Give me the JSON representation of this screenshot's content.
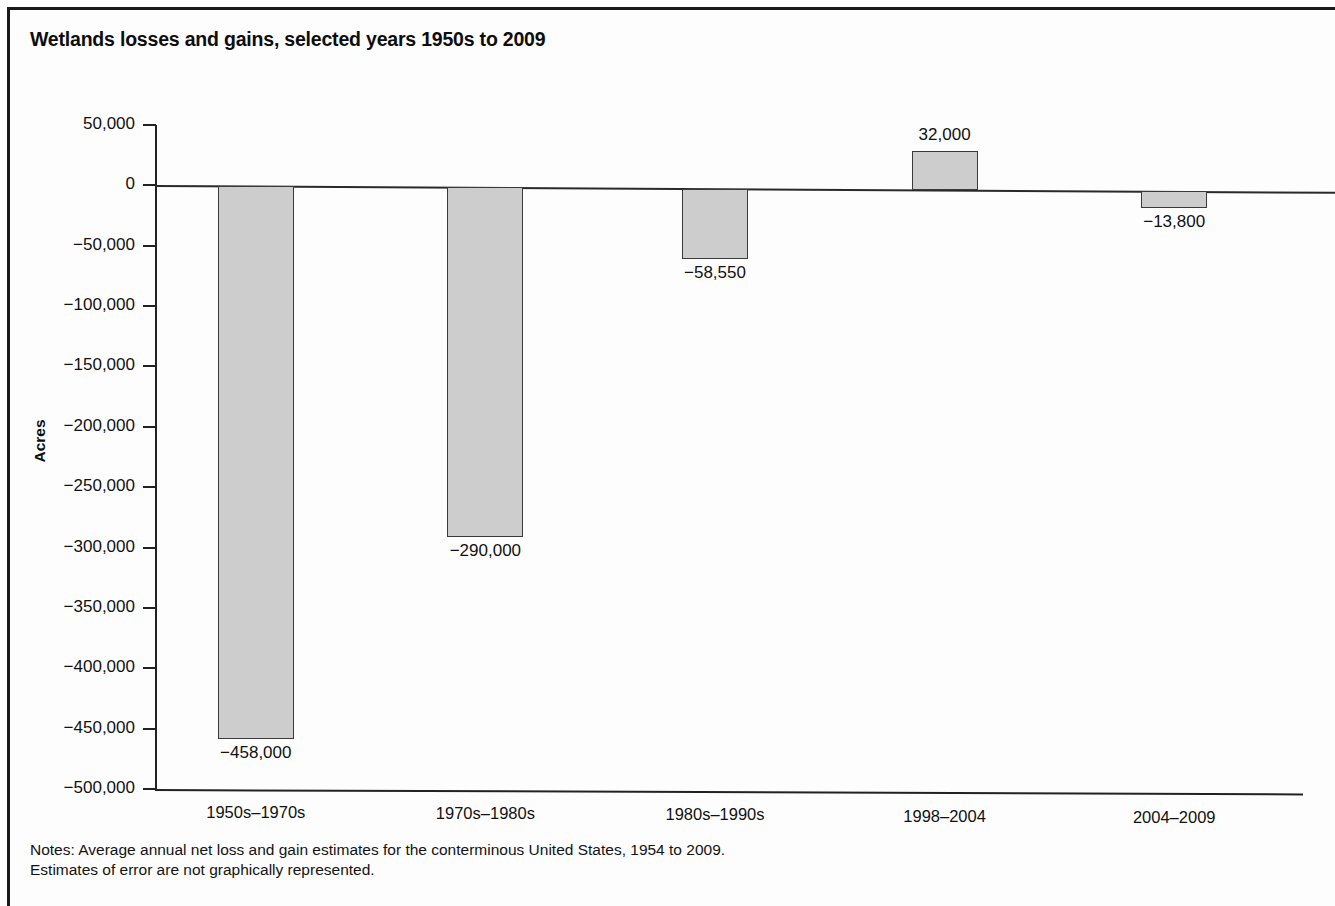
{
  "figure": {
    "title": "Wetlands losses and gains, selected years 1950s to 2009",
    "notes_line1": "Notes: Average annual net loss and gain estimates for the conterminous United States, 1954 to 2009.",
    "notes_line2": "Estimates of error are not graphically represented."
  },
  "chart_data": {
    "type": "bar",
    "title": "Wetlands losses and gains, selected years 1950s to 2009",
    "xlabel": "",
    "ylabel": "Acres",
    "categories": [
      "1950s–1970s",
      "1970s–1980s",
      "1980s–1990s",
      "1998–2004",
      "2004–2009"
    ],
    "values": [
      -458000,
      -290000,
      -58550,
      32000,
      -13800
    ],
    "data_labels": [
      "−458,000",
      "−290,000",
      "−58,550",
      "32,000",
      "−13,800"
    ],
    "ylim": [
      -500000,
      50000
    ],
    "ytick_values": [
      50000,
      0,
      -50000,
      -100000,
      -150000,
      -200000,
      -250000,
      -300000,
      -350000,
      -400000,
      -450000,
      -500000
    ],
    "ytick_labels": [
      "50,000",
      "0",
      "−50,000",
      "−100,000",
      "−150,000",
      "−200,000",
      "−250,000",
      "−300,000",
      "−350,000",
      "−400,000",
      "−450,000",
      "−500,000"
    ],
    "grid": false,
    "legend": null,
    "bar_fill_color": "#cdcdcd",
    "bar_edge_color": "#3a3a3a",
    "zero_reference_line": true
  }
}
